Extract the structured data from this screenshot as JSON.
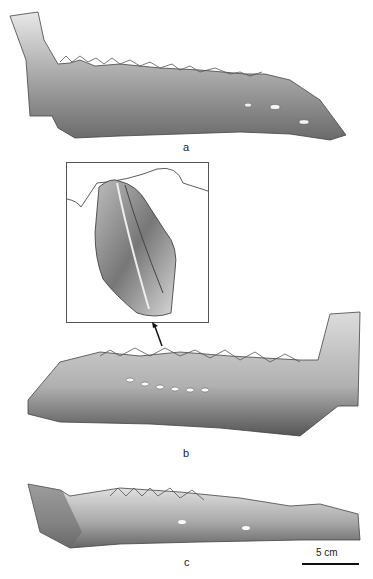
{
  "figure": {
    "panels": [
      {
        "id": "a",
        "label": "a",
        "description": "Lateral view of fossil lower jaw (mandible) with serrated teeth"
      },
      {
        "id": "b",
        "label": "b",
        "description": "Medial view of mandible with tooth row; arrow points to enlarged tooth"
      },
      {
        "id": "c",
        "label": "c",
        "description": "Another view of mandible fragment"
      }
    ],
    "inset": {
      "description": "Enlarged detail of a serrated tooth crown"
    },
    "scale_bar": {
      "label": "5 cm"
    },
    "colors": {
      "background": "#ffffff",
      "ink": "#222222"
    }
  }
}
